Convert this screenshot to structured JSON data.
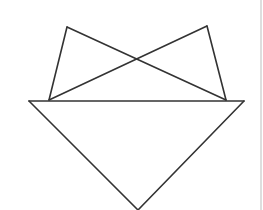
{
  "diagram": {
    "type": "geometric-figure",
    "stroke_color": "#333333",
    "background_color": "#ffffff",
    "border_color": "#c8c8c8",
    "vertices": {
      "A": [
        67,
        27
      ],
      "B": [
        207,
        26
      ],
      "C": [
        49,
        100
      ],
      "D": [
        226,
        100
      ],
      "E": [
        29,
        101
      ],
      "F": [
        244,
        101
      ],
      "G": [
        138,
        210
      ],
      "X": [
        138,
        45
      ]
    },
    "edges": [
      [
        "E",
        "F"
      ],
      [
        "E",
        "G"
      ],
      [
        "F",
        "G"
      ],
      [
        "C",
        "A"
      ],
      [
        "A",
        "D"
      ],
      [
        "D",
        "B"
      ],
      [
        "B",
        "C"
      ]
    ],
    "labels": []
  }
}
